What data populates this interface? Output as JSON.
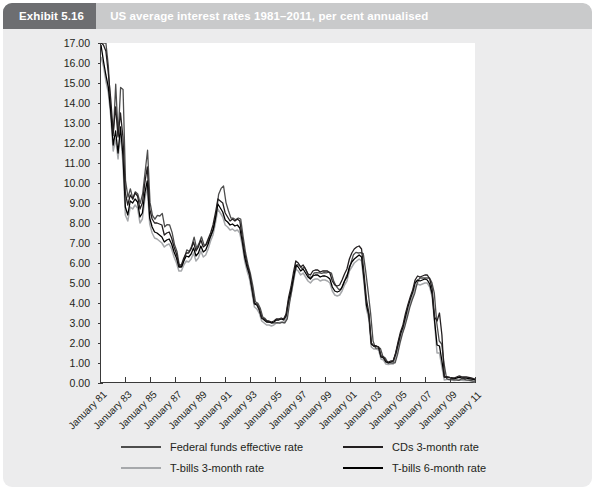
{
  "header": {
    "exhibit_label": "Exhibit 5.16",
    "title": "US average interest rates 1981–2011, per cent annualised",
    "badge_bg": "#6d6e71",
    "bar_bg": "#c9cacb",
    "text_color": "#ffffff"
  },
  "card": {
    "background": "#ececed"
  },
  "chart_data": {
    "type": "line",
    "title": "US average interest rates 1981–2011, per cent annualised",
    "xlabel": "",
    "ylabel": "",
    "ylim": [
      0,
      17
    ],
    "ytick_step": 1,
    "ytick_labels": [
      "0.00",
      "1.00",
      "2.00",
      "3.00",
      "4.00",
      "5.00",
      "6.00",
      "7.00",
      "8.00",
      "9.00",
      "10.00",
      "11.00",
      "12.00",
      "13.00",
      "14.00",
      "15.00",
      "16.00",
      "17.00"
    ],
    "xtick_labels": [
      "January 81",
      "January 83",
      "January 85",
      "January 87",
      "January 89",
      "January 91",
      "January 93",
      "January 95",
      "January 97",
      "January 99",
      "January 01",
      "January 03",
      "January 05",
      "January 07",
      "January 09",
      "January 11"
    ],
    "x_start_year": 1981,
    "x_end_year": 2011,
    "x_sample_step_years": 0.25,
    "grid": false,
    "legend_position": "bottom",
    "series": [
      {
        "name": "Federal funds effective rate",
        "color": "#4d4d4d",
        "values": [
          19.08,
          19.1,
          17.78,
          15.85,
          13.59,
          12.37,
          14.94,
          12.37,
          14.78,
          14.68,
          10.12,
          9.29,
          9.71,
          9.2,
          9.56,
          9.45,
          8.98,
          9.47,
          10.56,
          11.64,
          9.03,
          8.38,
          8.19,
          8.38,
          8.35,
          8.48,
          7.81,
          7.92,
          7.9,
          7.53,
          6.92,
          6.58,
          5.85,
          5.82,
          6.21,
          6.66,
          6.57,
          6.84,
          7.29,
          6.73,
          6.98,
          7.31,
          6.91,
          6.92,
          7.17,
          7.38,
          7.76,
          8.45,
          9.44,
          9.73,
          9.85,
          9.02,
          8.61,
          8.25,
          8.24,
          8.16,
          8.25,
          8.2,
          7.31,
          6.5,
          5.91,
          5.45,
          4.82,
          4.06,
          3.98,
          3.73,
          3.3,
          3.22,
          3.07,
          3.04,
          2.99,
          3.01,
          3.02,
          2.99,
          3.04,
          3.0,
          3.21,
          4.05,
          4.76,
          5.5,
          5.92,
          5.88,
          5.72,
          5.8,
          5.55,
          5.28,
          5.3,
          5.51,
          5.52,
          5.51,
          5.48,
          5.52,
          5.51,
          5.55,
          5.5,
          5.07,
          4.83,
          4.68,
          4.69,
          4.97,
          5.31,
          5.55,
          6.02,
          6.41,
          6.53,
          6.5,
          6.52,
          6.47,
          5.58,
          4.56,
          3.49,
          2.1,
          1.75,
          1.74,
          1.73,
          1.34,
          1.25,
          1.02,
          1.01,
          1.0,
          1.01,
          1.43,
          2.0,
          2.47,
          2.84,
          3.3,
          3.78,
          4.16,
          4.49,
          4.99,
          5.25,
          5.25,
          5.25,
          5.25,
          5.26,
          5.02,
          4.49,
          3.0,
          2.1,
          1.95,
          0.95,
          0.22,
          0.17,
          0.18,
          0.16,
          0.16,
          0.13,
          0.2,
          0.19,
          0.16,
          0.14,
          0.12,
          0.09,
          0.1
        ]
      },
      {
        "name": "T-bills 3-month rate",
        "color": "#a6a8ab",
        "values": [
          16.3,
          15.85,
          15.1,
          14.52,
          13.35,
          11.6,
          12.2,
          11.2,
          12.5,
          11.0,
          8.4,
          8.1,
          8.8,
          8.7,
          8.9,
          8.75,
          8.0,
          8.2,
          9.2,
          9.8,
          7.95,
          7.5,
          7.25,
          7.2,
          7.1,
          7.0,
          6.8,
          6.9,
          6.95,
          6.7,
          6.3,
          6.0,
          5.6,
          5.6,
          5.9,
          6.1,
          6.05,
          6.2,
          6.5,
          6.1,
          6.25,
          6.6,
          6.3,
          6.4,
          6.7,
          7.1,
          7.4,
          8.0,
          8.7,
          8.5,
          8.3,
          7.9,
          7.8,
          7.65,
          7.7,
          7.6,
          7.65,
          7.5,
          6.9,
          6.1,
          5.6,
          5.2,
          4.5,
          3.8,
          3.7,
          3.5,
          3.1,
          3.0,
          2.9,
          2.9,
          2.85,
          2.9,
          3.0,
          3.0,
          3.05,
          3.0,
          3.2,
          3.9,
          4.4,
          5.05,
          5.7,
          5.6,
          5.4,
          5.5,
          5.3,
          5.1,
          5.0,
          5.15,
          5.2,
          5.2,
          5.1,
          5.15,
          5.15,
          5.1,
          5.0,
          4.6,
          4.4,
          4.35,
          4.4,
          4.6,
          4.9,
          5.1,
          5.6,
          5.8,
          6.0,
          6.1,
          6.2,
          6.1,
          5.0,
          3.7,
          3.2,
          1.8,
          1.7,
          1.7,
          1.65,
          1.2,
          1.15,
          0.95,
          0.92,
          0.95,
          0.95,
          1.3,
          1.8,
          2.25,
          2.6,
          3.1,
          3.6,
          4.0,
          4.35,
          4.8,
          4.95,
          4.9,
          4.95,
          5.0,
          5.0,
          4.8,
          4.3,
          3.0,
          1.5,
          1.5,
          0.8,
          0.15,
          0.18,
          0.17,
          0.15,
          0.12,
          0.14,
          0.15,
          0.14,
          0.13,
          0.14,
          0.13,
          0.1,
          0.08,
          0.06
        ]
      },
      {
        "name": "CDs 3-month rate",
        "color": "#231f20",
        "values": [
          17.3,
          16.9,
          16.6,
          15.5,
          14.2,
          12.5,
          13.8,
          12.3,
          13.5,
          12.3,
          9.5,
          8.9,
          9.4,
          9.2,
          9.5,
          9.35,
          8.7,
          9.0,
          10.0,
          10.8,
          8.7,
          8.2,
          8.0,
          8.0,
          7.95,
          7.9,
          7.4,
          7.5,
          7.55,
          7.25,
          6.8,
          6.45,
          5.9,
          5.9,
          6.25,
          6.5,
          6.5,
          6.7,
          7.05,
          6.6,
          6.8,
          7.15,
          6.8,
          6.9,
          7.2,
          7.5,
          7.9,
          8.5,
          9.2,
          9.1,
          9.0,
          8.5,
          8.3,
          8.1,
          8.2,
          8.1,
          8.2,
          8.1,
          7.3,
          6.5,
          5.95,
          5.5,
          4.8,
          4.0,
          3.95,
          3.7,
          3.25,
          3.2,
          3.1,
          3.1,
          3.05,
          3.1,
          3.2,
          3.2,
          3.25,
          3.2,
          3.45,
          4.25,
          4.8,
          5.5,
          6.1,
          6.0,
          5.8,
          5.9,
          5.7,
          5.45,
          5.4,
          5.6,
          5.65,
          5.65,
          5.55,
          5.6,
          5.6,
          5.6,
          5.5,
          5.1,
          4.9,
          4.85,
          4.9,
          5.15,
          5.45,
          5.7,
          6.2,
          6.5,
          6.7,
          6.8,
          6.85,
          6.7,
          5.5,
          4.2,
          3.5,
          2.0,
          1.85,
          1.85,
          1.8,
          1.35,
          1.3,
          1.1,
          1.05,
          1.1,
          1.1,
          1.5,
          2.05,
          2.55,
          2.9,
          3.45,
          3.9,
          4.3,
          4.65,
          5.15,
          5.35,
          5.3,
          5.35,
          5.4,
          5.4,
          5.2,
          4.7,
          3.3,
          3.1,
          3.5,
          2.4,
          0.3,
          0.3,
          0.28,
          0.25,
          0.25,
          0.3,
          0.35,
          0.32,
          0.3,
          0.3,
          0.28,
          0.25,
          0.22,
          0.2
        ]
      },
      {
        "name": "T-bills 6-month rate",
        "color": "#000000",
        "values": [
          16.9,
          16.1,
          15.4,
          14.8,
          13.6,
          11.9,
          12.6,
          11.5,
          12.8,
          11.4,
          8.8,
          8.4,
          9.1,
          9.0,
          9.2,
          9.05,
          8.3,
          8.5,
          9.5,
          10.1,
          8.25,
          7.8,
          7.55,
          7.5,
          7.4,
          7.3,
          7.05,
          7.15,
          7.2,
          6.95,
          6.55,
          6.25,
          5.8,
          5.8,
          6.1,
          6.35,
          6.3,
          6.45,
          6.75,
          6.35,
          6.5,
          6.85,
          6.55,
          6.65,
          6.95,
          7.35,
          7.65,
          8.25,
          8.95,
          8.75,
          8.55,
          8.15,
          8.05,
          7.9,
          7.95,
          7.85,
          7.9,
          7.75,
          7.1,
          6.3,
          5.8,
          5.4,
          4.7,
          3.95,
          3.9,
          3.65,
          3.25,
          3.15,
          3.05,
          3.05,
          3.0,
          3.05,
          3.15,
          3.15,
          3.2,
          3.15,
          3.35,
          4.1,
          4.6,
          5.25,
          5.9,
          5.8,
          5.6,
          5.7,
          5.5,
          5.3,
          5.2,
          5.35,
          5.4,
          5.4,
          5.3,
          5.35,
          5.35,
          5.3,
          5.2,
          4.8,
          4.6,
          4.55,
          4.6,
          4.8,
          5.1,
          5.3,
          5.8,
          6.05,
          6.2,
          6.3,
          6.4,
          6.3,
          5.2,
          3.9,
          3.4,
          1.95,
          1.85,
          1.85,
          1.8,
          1.3,
          1.25,
          1.05,
          1.0,
          1.05,
          1.1,
          1.45,
          1.95,
          2.45,
          2.8,
          3.3,
          3.8,
          4.2,
          4.55,
          5.0,
          5.15,
          5.1,
          5.15,
          5.2,
          5.15,
          4.95,
          4.45,
          3.1,
          1.9,
          1.85,
          1.1,
          0.3,
          0.3,
          0.28,
          0.25,
          0.22,
          0.25,
          0.28,
          0.26,
          0.25,
          0.24,
          0.22,
          0.2,
          0.18,
          0.16
        ]
      }
    ]
  },
  "legend": {
    "items": [
      {
        "label": "Federal funds effective rate",
        "color": "#4d4d4d"
      },
      {
        "label": "CDs 3-month rate",
        "color": "#231f20"
      },
      {
        "label": "T-bills 3-month rate",
        "color": "#a6a8ab"
      },
      {
        "label": "T-bills 6-month rate",
        "color": "#000000"
      }
    ]
  },
  "axis": {
    "line_color": "#3a3a3a",
    "tick_color": "#3a3a3a",
    "label_color": "#231f20"
  }
}
